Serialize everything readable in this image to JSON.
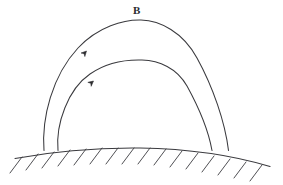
{
  "figure": {
    "background_color": "#ffffff",
    "stroke_color": "#3a3a3e",
    "label_color": "#2b2b2e",
    "width": 283,
    "height": 185
  },
  "labels": {
    "field_label": "B",
    "field_label_x": 133,
    "field_label_y": 5
  },
  "chart_data": {
    "type": "line",
    "xlabel": "",
    "ylabel": "",
    "grid": false,
    "legend": "none",
    "annotations": [
      {
        "text": "B",
        "x": 137,
        "y": 11,
        "describes": "magnetic field"
      }
    ],
    "series": [
      {
        "name": "outer-field-line",
        "label": "B",
        "x": [
          44,
          47,
          53,
          63,
          77,
          95,
          118,
          140,
          163,
          185,
          202,
          215,
          224,
          228
        ],
        "y": [
          150,
          131,
          109,
          86,
          63,
          44,
          28,
          20,
          24,
          38,
          58,
          85,
          118,
          150
        ]
      },
      {
        "name": "inner-field-line",
        "label": "",
        "x": [
          58,
          61,
          67,
          77,
          91,
          108,
          126,
          142,
          160,
          178,
          193,
          204,
          210,
          212
        ],
        "y": [
          150,
          136,
          118,
          100,
          82,
          68,
          61,
          60,
          64,
          75,
          92,
          112,
          133,
          150
        ]
      },
      {
        "name": "ground-surface",
        "label": "",
        "x": [
          15,
          45,
          75,
          105,
          130,
          160,
          190,
          215,
          240,
          270
        ],
        "y": [
          158,
          153,
          150,
          148,
          148,
          149,
          152,
          156,
          161,
          166
        ]
      }
    ],
    "markers": [
      {
        "name": "outer-line-arrow",
        "x": 86,
        "y": 51,
        "angle_deg": -47,
        "direction": "upward-along-curve"
      },
      {
        "name": "inner-line-arrow",
        "x": 93,
        "y": 81,
        "angle_deg": -40,
        "direction": "upward-along-curve"
      }
    ],
    "hatching": {
      "name": "ground-hatching",
      "count": 16,
      "side": "below",
      "slant_deg": 52,
      "length": 20
    }
  }
}
